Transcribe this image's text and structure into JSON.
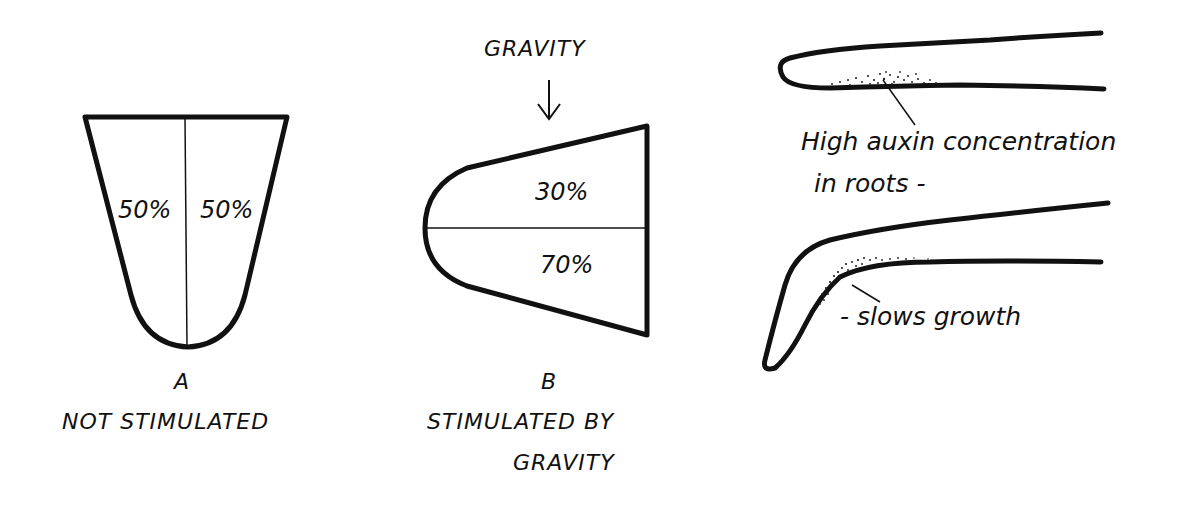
{
  "panel_a": {
    "left_percent": "50%",
    "right_percent": "50%",
    "letter": "A",
    "caption": "NOT STIMULATED"
  },
  "panel_b": {
    "force_label": "GRAVITY",
    "arrow_icon": "down-arrow",
    "upper_percent": "30%",
    "lower_percent": "70%",
    "letter": "B",
    "caption_line1": "STIMULATED BY",
    "caption_line2": "GRAVITY"
  },
  "panel_roots": {
    "annotation_1_line1": "High auxin concentration",
    "annotation_1_line2": "in roots -",
    "annotation_2": "- slows growth"
  },
  "colors": {
    "ink": "#111111",
    "background": "#ffffff"
  }
}
